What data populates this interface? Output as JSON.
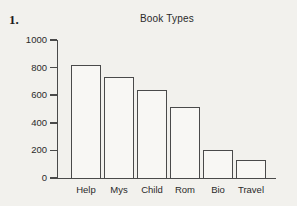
{
  "page": {
    "problem_number": "1.",
    "background_color": "#f2f1ed",
    "text_color": "#2a2a2a",
    "line_color": "#4a4a4a",
    "bar_fill_color": "#f8f7f4"
  },
  "chart_data": {
    "type": "bar",
    "title": "Book Types",
    "categories": [
      "Help",
      "Mys",
      "Child",
      "Rom",
      "Bio",
      "Travel"
    ],
    "values": [
      820,
      730,
      640,
      515,
      200,
      130
    ],
    "xlabel": "",
    "ylabel": "",
    "ylim": [
      0,
      1000
    ],
    "yticks": [
      0,
      200,
      400,
      600,
      800,
      1000
    ],
    "grid": false,
    "legend": false,
    "bar_style": "outlined-unfilled"
  }
}
